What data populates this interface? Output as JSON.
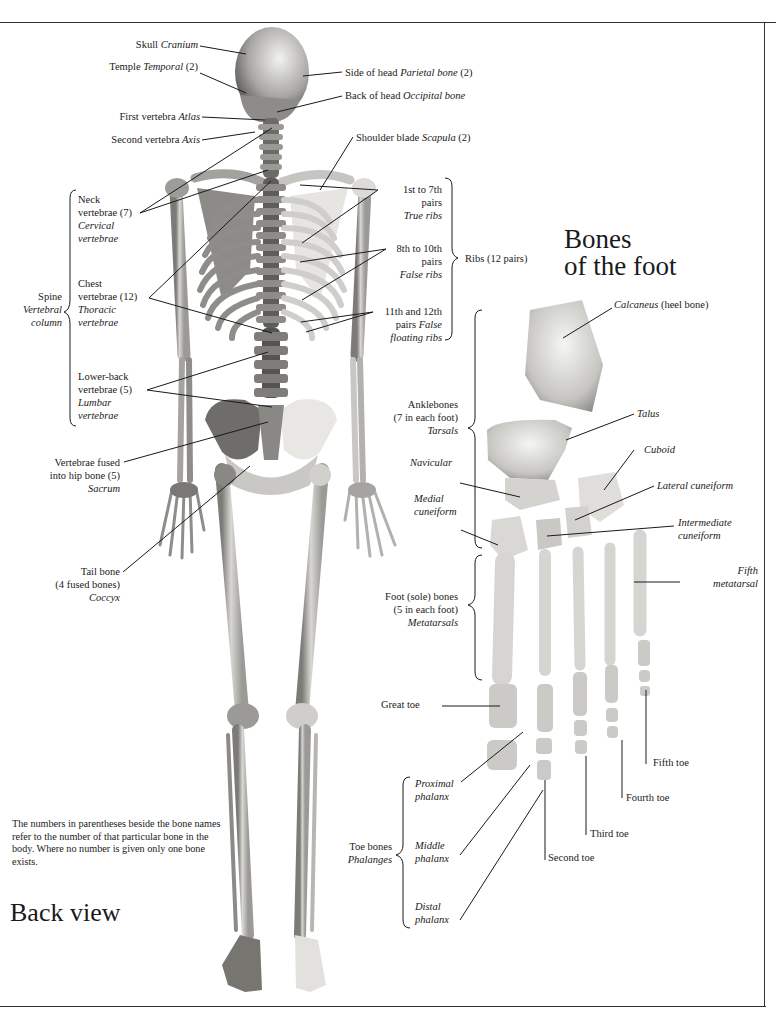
{
  "skeleton_labels": {
    "skull": {
      "common": "Skull",
      "latin": "Cranium"
    },
    "temple": {
      "common": "Temple",
      "latin": "Temporal",
      "count": "(2)"
    },
    "parietal": {
      "common": "Side of head",
      "latin": "Parietal bone",
      "count": "(2)"
    },
    "occipital": {
      "common": "Back of head",
      "latin": "Occipital bone"
    },
    "atlas": {
      "common": "First vertebra",
      "latin": "Atlas"
    },
    "axis": {
      "common": "Second vertebra",
      "latin": "Axis"
    },
    "scapula": {
      "common": "Shoulder blade",
      "latin": "Scapula",
      "count": "(2)"
    },
    "neck": {
      "line1": "Neck",
      "line2": "vertebrae (7)",
      "latin1": "Cervical",
      "latin2": "vertebrae"
    },
    "chest": {
      "line1": "Chest",
      "line2": "vertebrae (12)",
      "latin1": "Thoracic",
      "latin2": "vertebrae"
    },
    "lumbar": {
      "line1": "Lower-back",
      "line2": "vertebrae (5)",
      "latin1": "Lumbar",
      "latin2": "vertebrae"
    },
    "spine": {
      "common": "Spine",
      "latin1": "Vertebral",
      "latin2": "column"
    },
    "true_ribs": {
      "line1": "1st to 7th",
      "line2": "pairs",
      "latin": "True ribs"
    },
    "false_ribs": {
      "line1": "8th to 10th",
      "line2": "pairs",
      "latin": "False ribs"
    },
    "floating_ribs": {
      "line1": "11th and 12th",
      "line2a": "pairs",
      "line2b": "False",
      "latin": "floating ribs"
    },
    "ribs": {
      "label": "Ribs (12 pairs)"
    },
    "sacrum": {
      "line1": "Vertebrae fused",
      "line2": "into hip bone (5)",
      "latin": "Sacrum"
    },
    "coccyx": {
      "line1": "Tail bone",
      "line2": "(4 fused bones)",
      "latin": "Coccyx"
    }
  },
  "foot_title": {
    "line1": "Bones",
    "line2": "of the foot"
  },
  "foot_labels": {
    "calcaneus": {
      "latin": "Calcaneus",
      "common": "(heel bone)"
    },
    "talus": "Talus",
    "cuboid": "Cuboid",
    "lateral_cuneiform": "Lateral cuneiform",
    "intermediate_cuneiform": {
      "line1": "Intermediate",
      "line2": "cuneiform"
    },
    "fifth_metatarsal": {
      "line1": "Fifth",
      "line2": "metatarsal"
    },
    "navicular": "Navicular",
    "medial_cuneiform": {
      "line1": "Medial",
      "line2": "cuneiform"
    },
    "tarsals": {
      "line1": "Anklebones",
      "line2": "(7 in each foot)",
      "latin": "Tarsals"
    },
    "metatarsals": {
      "line1": "Foot (sole) bones",
      "line2": "(5 in each foot)",
      "latin": "Metatarsals"
    },
    "great_toe": "Great toe",
    "second_toe": "Second toe",
    "third_toe": "Third toe",
    "fourth_toe": "Fourth toe",
    "fifth_toe": "Fifth toe",
    "phalanges": {
      "common": "Toe bones",
      "latin": "Phalanges"
    },
    "proximal": {
      "line1": "Proximal",
      "line2": "phalanx"
    },
    "middle": {
      "line1": "Middle",
      "line2": "phalanx"
    },
    "distal": {
      "line1": "Distal",
      "line2": "phalanx"
    }
  },
  "note": "The numbers in parentheses beside the bone names refer to the number of that particular bone in the body. Where no number is given only one bone exists.",
  "view_title": "Back view",
  "colors": {
    "bone_light": "#eeeeec",
    "bone_mid": "#b9b8b4",
    "bone_dark": "#6e6c68",
    "ink": "#1a1a1a"
  }
}
